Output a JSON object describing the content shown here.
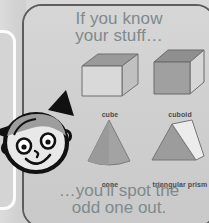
{
  "card": {
    "heading_line1": "If you know",
    "heading_line2": "your stuff…",
    "footer_line1": "…you'll spot the",
    "footer_line2": "odd one out.",
    "text_color": "#7e8a8d",
    "panel_color": "#d2d2d2",
    "border_color": "#5d5d5d"
  },
  "shapes": [
    {
      "id": "cube",
      "label": "cube",
      "icon": "cube-shape"
    },
    {
      "id": "cuboid",
      "label": "cuboid",
      "icon": "cuboid-shape"
    },
    {
      "id": "cone",
      "label": "cone",
      "icon": "cone-shape"
    },
    {
      "id": "triangular_prism",
      "label": "triangular prism",
      "icon": "triangular-prism-shape"
    }
  ],
  "character": {
    "name": "girl-character",
    "features": [
      "pigtails",
      "eyes",
      "smile",
      "ears",
      "hair"
    ],
    "outline_color": "#111111",
    "skin_color": "#e8e8e8"
  }
}
